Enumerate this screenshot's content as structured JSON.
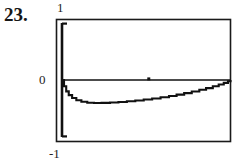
{
  "problem": {
    "number_label": "23."
  },
  "plot": {
    "name": "graphing-calculator-plot",
    "frame_color": "#1a1a1a",
    "curve_color": "#111111",
    "axis_color": "#111111",
    "background_color": "#ffffff",
    "y_axis_top_label": "1",
    "y_axis_zero_label": "0",
    "y_axis_bottom_label": "-1"
  },
  "chart_data": {
    "type": "line",
    "title": "",
    "xlabel": "",
    "ylabel": "",
    "xlim": [
      0,
      1
    ],
    "ylim": [
      -1,
      1
    ],
    "grid": false,
    "legend": null,
    "yticks": [
      1,
      0,
      -1
    ],
    "ytick_labels": [
      "1",
      "0",
      "-1"
    ],
    "xticks": [],
    "xtick_labels": [],
    "annotations": [
      {
        "name": "zero-line",
        "type": "hline",
        "y": 0
      },
      {
        "name": "zero-line-tick",
        "type": "marker",
        "x": 0.515,
        "y": 0
      }
    ],
    "series": [
      {
        "name": "curve",
        "x": [
          0.0,
          0.012,
          0.025,
          0.04,
          0.06,
          0.085,
          0.115,
          0.15,
          0.19,
          0.235,
          0.285,
          0.335,
          0.385,
          0.435,
          0.485,
          0.535,
          0.585,
          0.635,
          0.68,
          0.725,
          0.77,
          0.815,
          0.855,
          0.895,
          0.93,
          0.96,
          0.985,
          1.0
        ],
        "y": [
          0.0,
          -0.11,
          -0.2,
          -0.265,
          -0.315,
          -0.355,
          -0.382,
          -0.398,
          -0.404,
          -0.402,
          -0.396,
          -0.386,
          -0.374,
          -0.36,
          -0.343,
          -0.324,
          -0.303,
          -0.28,
          -0.256,
          -0.23,
          -0.202,
          -0.172,
          -0.142,
          -0.11,
          -0.079,
          -0.05,
          -0.022,
          0.0
        ]
      }
    ]
  }
}
